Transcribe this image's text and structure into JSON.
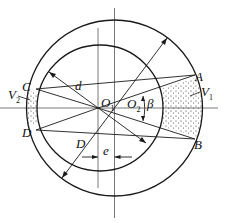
{
  "diagram": {
    "title": "",
    "labels": {
      "A": "A",
      "B": "B",
      "C": "C",
      "D_point": "D",
      "d": "d",
      "D_diameter": "D",
      "O1": "O",
      "O1_sub": "1",
      "O2": "O",
      "O2_sub": "2",
      "beta": "β",
      "V1": "V",
      "V1_sub": "1",
      "V2": "V",
      "V2_sub": "2",
      "e": "e"
    },
    "colors": {
      "stroke": "#1a1a1a",
      "axis": "#555555",
      "stipple": "#333333"
    }
  }
}
